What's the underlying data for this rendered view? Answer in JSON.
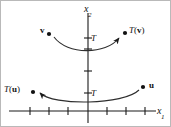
{
  "figure": {
    "kind": "coordinate-plane-diagram",
    "width": 171,
    "height": 127,
    "background": "#ffffff",
    "border_color": "#b9b9b9",
    "ink_color": "#1a1a1a"
  },
  "axes": {
    "x_axis": {
      "label_main": "x",
      "label_sub": "1",
      "y_px": 110,
      "x_start_px": 8,
      "x_end_px": 155,
      "ticks_px": [
        29,
        48,
        67,
        106,
        125,
        144
      ],
      "tick_half_len_px": 4
    },
    "y_axis": {
      "label_main": "x",
      "label_sub": "2",
      "x_px": 87,
      "y_start_px": 12,
      "y_end_px": 122,
      "ticks_px": [
        37,
        48,
        70,
        92
      ],
      "tick_half_len_px": 4
    }
  },
  "points": [
    {
      "id": "v",
      "label": "v",
      "dot_x": 48,
      "dot_y": 33,
      "bold": true
    },
    {
      "id": "Tv",
      "label": "T(v)",
      "dot_x": 124,
      "dot_y": 32,
      "bold": false
    },
    {
      "id": "Tu",
      "label": "T(u)",
      "dot_x": 32,
      "dot_y": 91,
      "bold": false
    },
    {
      "id": "u",
      "label": "u",
      "dot_x": 142,
      "dot_y": 86,
      "bold": true
    }
  ],
  "mapping_arrows": [
    {
      "id": "arrow-v-to-Tv",
      "transform_label": "T",
      "from": "v",
      "to": "Tv",
      "direction": "left-to-right",
      "path": "M 53 36 C 66 54, 105 54, 119 36"
    },
    {
      "id": "arrow-u-to-Tu",
      "transform_label": "T",
      "from": "u",
      "to": "Tu",
      "direction": "right-to-left",
      "path": "M 138 89 C 124 104, 52 104, 38 92"
    }
  ],
  "transform_labels": [
    {
      "id": "T-upper",
      "text": "T"
    },
    {
      "id": "T-lower",
      "text": "T"
    }
  ]
}
